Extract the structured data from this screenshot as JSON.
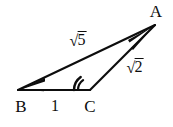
{
  "figure": {
    "kind": "geometry-diagram",
    "background_color": "#ffffff",
    "stroke_color": "#0d0d0d",
    "vertices": [
      {
        "name": "A",
        "label": "A",
        "x": 155,
        "y": 25,
        "label_x": 156,
        "label_y": 11
      },
      {
        "name": "B",
        "label": "B",
        "x": 18,
        "y": 90,
        "label_x": 21,
        "label_y": 106
      },
      {
        "name": "C",
        "label": "C",
        "x": 90,
        "y": 90,
        "label_x": 90,
        "label_y": 106
      }
    ],
    "edges": [
      {
        "name": "BA",
        "from": "B",
        "to": "A"
      },
      {
        "name": "BC",
        "from": "B",
        "to": "C"
      },
      {
        "name": "CA",
        "from": "C",
        "to": "A"
      }
    ],
    "side_labels": [
      {
        "name": "side-BA-label",
        "root_sign": "√",
        "radicand": "5",
        "text": "√5",
        "x": 78,
        "y": 40
      },
      {
        "name": "side-BC-label",
        "root_sign": "",
        "radicand": "",
        "text": "1",
        "x": 55,
        "y": 106
      },
      {
        "name": "side-CA-label",
        "root_sign": "√",
        "radicand": "2",
        "text": "√2",
        "x": 135,
        "y": 67
      }
    ],
    "angle_markers": [
      {
        "name": "angle-C-marker",
        "at_vertex": "C",
        "arcs": 2,
        "type": "obtuse-double-arc"
      }
    ]
  }
}
